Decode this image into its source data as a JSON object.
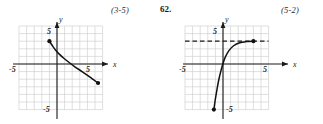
{
  "page": {
    "background_color": "#ffffff",
    "ink_color": "#1a1a1a",
    "grid_color": "#c9c9c9",
    "curve_color": "#111111"
  },
  "annotations": {
    "left_reference": "(3-5)",
    "problem_number": "62.",
    "right_reference": "(5-2)"
  },
  "figures": [
    {
      "id": "left",
      "name": "decreasing-curve-graph",
      "axis_labels": {
        "x": "x",
        "y": "y"
      },
      "tick_labels": {
        "x_negative": "-5",
        "x_positive": "5",
        "y_positive": "5",
        "y_negative": "-5"
      },
      "has_dashed_asymptote": false
    },
    {
      "id": "right",
      "name": "exponential-curve-graph",
      "axis_labels": {
        "x": "x",
        "y": "y"
      },
      "tick_labels": {
        "x_negative": "-5",
        "x_positive": "5",
        "y_positive": "5",
        "y_negative": "-5"
      },
      "has_dashed_asymptote": true
    }
  ],
  "chart_data": [
    {
      "type": "line",
      "id": "left-graph",
      "title": "",
      "xlabel": "x",
      "ylabel": "y",
      "xlim": [
        -6,
        6
      ],
      "ylim": [
        -6,
        6
      ],
      "xticks": [
        -5,
        5
      ],
      "yticks": [
        -5,
        5
      ],
      "xtick_labels": [
        "-5",
        "5"
      ],
      "ytick_labels": [
        "-5",
        "5"
      ],
      "grid": true,
      "grid_step": 1,
      "legend": "none",
      "series": [
        {
          "name": "decreasing-curve",
          "style": "solid",
          "endpoint_markers": [
            "filled-dot",
            "filled-dot"
          ],
          "x": [
            -1.0,
            -0.6,
            -0.2,
            0.3,
            0.9,
            1.6,
            2.4,
            3.3,
            4.3,
            5.4
          ],
          "y": [
            3.0,
            2.4,
            1.85,
            1.3,
            0.75,
            0.2,
            -0.4,
            -1.0,
            -1.7,
            -2.5
          ]
        }
      ]
    },
    {
      "type": "line",
      "id": "right-graph",
      "title": "",
      "xlabel": "x",
      "ylabel": "y",
      "xlim": [
        -6,
        6
      ],
      "ylim": [
        -6,
        6
      ],
      "xticks": [
        -5,
        5
      ],
      "yticks": [
        -5,
        5
      ],
      "xtick_labels": [
        "-5",
        "5"
      ],
      "ytick_labels": [
        "-5",
        "5"
      ],
      "grid": true,
      "grid_step": 1,
      "legend": "none",
      "annotations": [
        {
          "kind": "horizontal-asymptote",
          "style": "dashed",
          "y": 3,
          "x_start": -6,
          "x_end": 6
        }
      ],
      "series": [
        {
          "name": "exponential-curve",
          "style": "solid",
          "endpoint_markers": [
            "filled-dot",
            "filled-dot"
          ],
          "x": [
            -1.2,
            -1.0,
            -0.8,
            -0.6,
            -0.35,
            -0.05,
            0.3,
            0.8,
            1.4,
            2.2,
            3.1,
            4.0
          ],
          "y": [
            -6.0,
            -4.6,
            -3.4,
            -2.3,
            -1.2,
            -0.1,
            0.9,
            1.8,
            2.4,
            2.8,
            2.95,
            3.0
          ]
        }
      ]
    }
  ]
}
